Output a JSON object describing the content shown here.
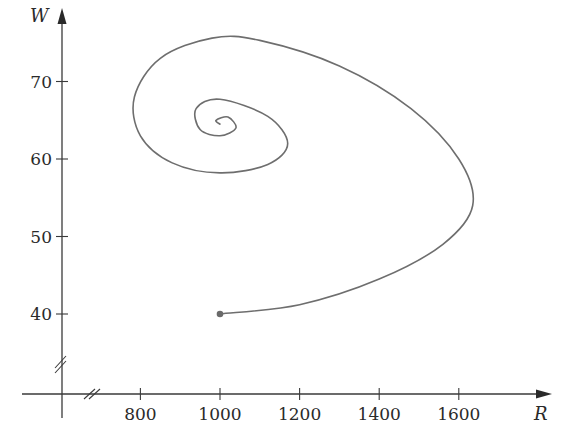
{
  "chart_data": {
    "type": "line",
    "title": "",
    "xlabel": "R",
    "ylabel": "W",
    "xlim": [
      600,
      1800
    ],
    "ylim": [
      30,
      78
    ],
    "x_ticks": [
      800,
      1000,
      1200,
      1400,
      1600
    ],
    "x_tick_labels": [
      "800",
      "1000",
      "1200",
      "1400",
      "1600"
    ],
    "y_ticks": [
      40,
      50,
      60,
      70
    ],
    "y_tick_labels": [
      "40",
      "50",
      "60",
      "70"
    ],
    "axis_breaks": {
      "x": true,
      "y": true
    },
    "grid": false,
    "legend": null,
    "series": [
      {
        "name": "phase trajectory (R, W)",
        "start_point": {
          "R": 1000,
          "W": 40
        },
        "equilibrium": {
          "R": 1000,
          "W": 64.5
        },
        "points": [
          {
            "R": 1000,
            "W": 40
          },
          {
            "R": 1200,
            "W": 41.2
          },
          {
            "R": 1400,
            "W": 44.5
          },
          {
            "R": 1560,
            "W": 49
          },
          {
            "R": 1635,
            "W": 54
          },
          {
            "R": 1600,
            "W": 60
          },
          {
            "R": 1480,
            "W": 66.5
          },
          {
            "R": 1300,
            "W": 72
          },
          {
            "R": 1100,
            "W": 75.3
          },
          {
            "R": 980,
            "W": 75.6
          },
          {
            "R": 850,
            "W": 73
          },
          {
            "R": 785,
            "W": 68
          },
          {
            "R": 800,
            "W": 63
          },
          {
            "R": 880,
            "W": 59.5
          },
          {
            "R": 1000,
            "W": 58.2
          },
          {
            "R": 1120,
            "W": 59.3
          },
          {
            "R": 1170,
            "W": 62
          },
          {
            "R": 1120,
            "W": 65.5
          },
          {
            "R": 1000,
            "W": 67.7
          },
          {
            "R": 940,
            "W": 66.5
          },
          {
            "R": 950,
            "W": 63.8
          },
          {
            "R": 1000,
            "W": 63
          },
          {
            "R": 1040,
            "W": 64
          },
          {
            "R": 1020,
            "W": 65.4
          },
          {
            "R": 990,
            "W": 65
          },
          {
            "R": 1000,
            "W": 64.5
          }
        ]
      }
    ]
  }
}
